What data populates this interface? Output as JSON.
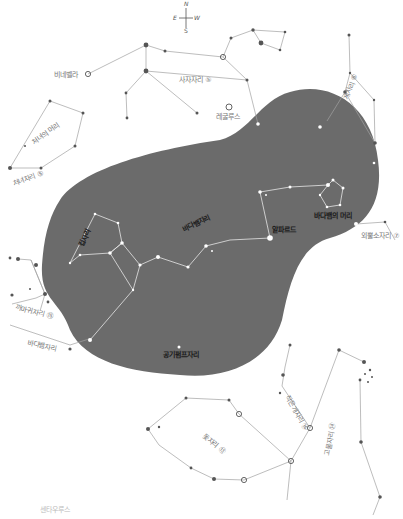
{
  "compass": {
    "north": "N",
    "south": "S",
    "east": "E",
    "west": "W"
  },
  "region": {
    "fill": "#6b6b6b"
  },
  "colors": {
    "line_outside": "#9a9a9a",
    "line_inside": "#e8e8e8",
    "star_outside": "#555555",
    "star_inside": "#ffffff"
  },
  "labels": {
    "vindemiatrix": "비네벨라",
    "leo": "사자자리 ⑤",
    "regulus": "레굴루스",
    "cancer": "게자리 ⑥",
    "hydra_head_left": "처녀의 머리",
    "virgo": "처녀자리 ⑤",
    "crater": "컵자리",
    "hydra": "바다뱀자리",
    "alphard": "알파르드",
    "hydra_head": "바다뱀의 머리",
    "monoceros": "외뿔소자리 ⑦",
    "corvus_left": "까마귀자리 ⑮",
    "hydra_tail": "바다뱀자리",
    "antlia": "공기펌프자리",
    "canis_minor": "작은개자리 ⑯",
    "puppis": "고물자리 ⑭",
    "vela": "돛자리 ⑬",
    "footer": "센타우루스"
  }
}
